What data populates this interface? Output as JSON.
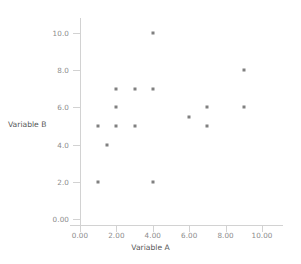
{
  "chart_data": {
    "type": "scatter",
    "title": "",
    "xlabel": "Variable A",
    "ylabel": "Variable B",
    "xlim": [
      0,
      11.2
    ],
    "ylim": [
      0,
      10.6
    ],
    "grid": false,
    "legend": null,
    "marker": {
      "shape": "square",
      "color": "#808080",
      "size_px": 3
    },
    "x_ticks": [
      {
        "value": 0,
        "label": "0.00"
      },
      {
        "value": 2,
        "label": "2.00"
      },
      {
        "value": 4,
        "label": "4.00"
      },
      {
        "value": 6,
        "label": "6.00"
      },
      {
        "value": 8,
        "label": "8.00"
      },
      {
        "value": 10,
        "label": "10.00"
      }
    ],
    "y_ticks": [
      {
        "value": 0,
        "label": "0.00"
      },
      {
        "value": 2,
        "label": "2.0"
      },
      {
        "value": 4,
        "label": "4.0"
      },
      {
        "value": 6,
        "label": "6.0"
      },
      {
        "value": 8,
        "label": "8.0"
      },
      {
        "value": 10,
        "label": "10.0"
      }
    ],
    "points": [
      {
        "x": 4,
        "y": 10
      },
      {
        "x": 9,
        "y": 8
      },
      {
        "x": 2,
        "y": 7
      },
      {
        "x": 3,
        "y": 7
      },
      {
        "x": 4,
        "y": 7
      },
      {
        "x": 2,
        "y": 6
      },
      {
        "x": 7,
        "y": 6
      },
      {
        "x": 9,
        "y": 6
      },
      {
        "x": 6,
        "y": 5.5
      },
      {
        "x": 1,
        "y": 5
      },
      {
        "x": 2,
        "y": 5
      },
      {
        "x": 3,
        "y": 5
      },
      {
        "x": 7,
        "y": 5
      },
      {
        "x": 1.5,
        "y": 4
      },
      {
        "x": 1,
        "y": 2
      },
      {
        "x": 4,
        "y": 2
      }
    ]
  },
  "axes": {
    "x_title": "Variable A",
    "y_title": "Variable B"
  },
  "colors": {
    "marker": "#808080",
    "axis": "#d2d2d2",
    "tick_text": "#8c8c8c",
    "title_text": "#555555",
    "background": "#ffffff"
  }
}
